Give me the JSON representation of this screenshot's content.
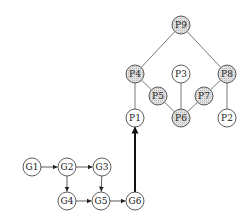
{
  "diagram": {
    "colors": {
      "stroke": "#333333",
      "shaded_fill": "#d4d4d4",
      "plain_fill": "#ffffff",
      "background": "#ffffff"
    },
    "node_radius": 9,
    "nodes": [
      {
        "id": "G1",
        "label": "G1",
        "x": 32,
        "y": 167,
        "shaded": false
      },
      {
        "id": "G2",
        "label": "G2",
        "x": 67,
        "y": 167,
        "shaded": false
      },
      {
        "id": "G3",
        "label": "G3",
        "x": 102,
        "y": 167,
        "shaded": false
      },
      {
        "id": "G4",
        "label": "G4",
        "x": 67,
        "y": 201,
        "shaded": false
      },
      {
        "id": "G5",
        "label": "G5",
        "x": 101,
        "y": 201,
        "shaded": false
      },
      {
        "id": "G6",
        "label": "G6",
        "x": 135,
        "y": 201,
        "shaded": false
      },
      {
        "id": "P1",
        "label": "P1",
        "x": 135,
        "y": 118,
        "shaded": false
      },
      {
        "id": "P2",
        "label": "P2",
        "x": 227,
        "y": 118,
        "shaded": false
      },
      {
        "id": "P3",
        "label": "P3",
        "x": 181,
        "y": 74,
        "shaded": false
      },
      {
        "id": "P4",
        "label": "P4",
        "x": 135,
        "y": 74,
        "shaded": true
      },
      {
        "id": "P5",
        "label": "P5",
        "x": 158,
        "y": 96,
        "shaded": true
      },
      {
        "id": "P6",
        "label": "P6",
        "x": 181,
        "y": 118,
        "shaded": true
      },
      {
        "id": "P7",
        "label": "P7",
        "x": 204,
        "y": 96,
        "shaded": true
      },
      {
        "id": "P8",
        "label": "P8",
        "x": 227,
        "y": 74,
        "shaded": true
      },
      {
        "id": "P9",
        "label": "P9",
        "x": 181,
        "y": 25,
        "shaded": true
      }
    ],
    "arrows": [
      {
        "from": "G1",
        "to": "G2"
      },
      {
        "from": "G2",
        "to": "G3"
      },
      {
        "from": "G2",
        "to": "G4"
      },
      {
        "from": "G3",
        "to": "G5"
      },
      {
        "from": "G4",
        "to": "G5"
      },
      {
        "from": "G5",
        "to": "G6"
      }
    ],
    "thick_arrows": [
      {
        "from": "G6",
        "to": "P1"
      }
    ],
    "edges": [
      {
        "from": "P9",
        "to": "P4"
      },
      {
        "from": "P9",
        "to": "P8"
      },
      {
        "from": "P4",
        "to": "P1"
      },
      {
        "from": "P4",
        "to": "P5"
      },
      {
        "from": "P5",
        "to": "P6"
      },
      {
        "from": "P3",
        "to": "P6"
      },
      {
        "from": "P7",
        "to": "P6"
      },
      {
        "from": "P8",
        "to": "P7"
      },
      {
        "from": "P8",
        "to": "P2"
      }
    ]
  }
}
